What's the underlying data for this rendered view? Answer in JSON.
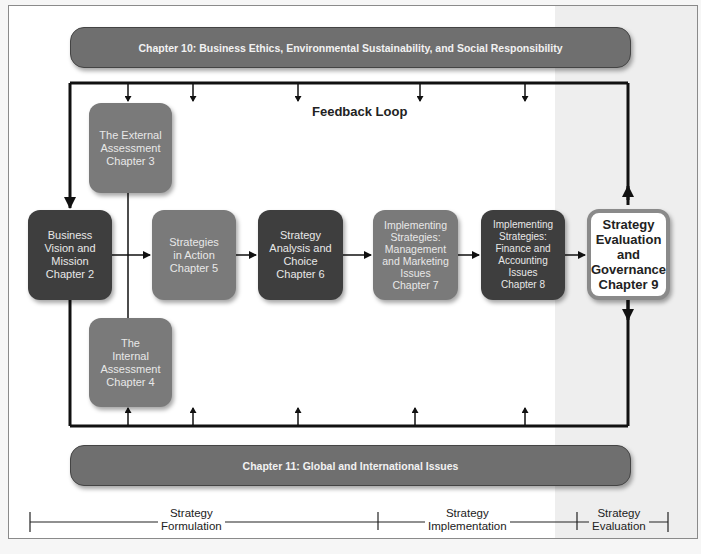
{
  "top_banner": {
    "label": "Chapter 10: Business Ethics, Environmental Sustainability, and Social Responsibility"
  },
  "bottom_banner": {
    "label": "Chapter 11: Global and International Issues"
  },
  "feedback_label": "Feedback Loop",
  "boxes": [
    {
      "id": "external",
      "label": "The External\nAssessment\nChapter 3",
      "shade": "mid"
    },
    {
      "id": "vision",
      "label": "Business\nVision and\nMission\nChapter 2",
      "shade": "dark"
    },
    {
      "id": "strategies_action",
      "label": "Strategies\nin Action\nChapter 5",
      "shade": "mid"
    },
    {
      "id": "analysis_choice",
      "label": "Strategy\nAnalysis and\nChoice\nChapter 6",
      "shade": "dark"
    },
    {
      "id": "impl_mgmt",
      "label": "Implementing\nStrategies:\nManagement\nand Marketing\nIssues\nChapter 7",
      "shade": "mid"
    },
    {
      "id": "impl_fin",
      "label": "Implementing\nStrategies:\nFinance and\nAccounting\nIssues\nChapter 8",
      "shade": "dark"
    },
    {
      "id": "evaluation",
      "label": "Strategy\nEvaluation\nand\nGovernance\nChapter 9",
      "shade": "white"
    },
    {
      "id": "internal",
      "label": "The\nInternal\nAssessment\nChapter 4",
      "shade": "mid"
    }
  ],
  "stages": [
    {
      "label": "Strategy\nFormulation"
    },
    {
      "label": "Strategy\nImplementation"
    },
    {
      "label": "Strategy\nEvaluation"
    }
  ],
  "colors": {
    "dark_box": "#3e3e3e",
    "mid_box": "#7a7a7a",
    "banner": "#6f6f6f",
    "line": "#111111"
  }
}
